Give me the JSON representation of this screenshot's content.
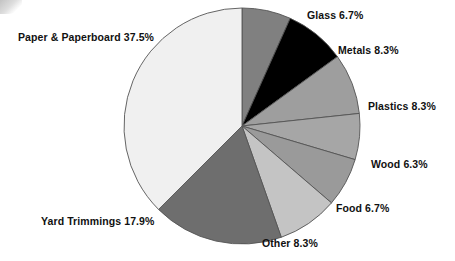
{
  "chart_data": {
    "type": "pie",
    "title": "",
    "subtitle": "",
    "xlabel": "",
    "ylabel": "",
    "legend_position": "none",
    "grid": false,
    "units": "percent",
    "start_angle_deg": 0,
    "direction": "clockwise",
    "center": {
      "x": 242,
      "y": 126
    },
    "radius": 118,
    "categories": [
      "Glass",
      "Metals",
      "Plastics",
      "Wood",
      "Food",
      "Other",
      "Yard Trimmings",
      "Paper & Paperboard"
    ],
    "values": [
      6.7,
      8.3,
      8.3,
      6.3,
      6.7,
      8.3,
      17.9,
      37.5
    ],
    "colors": [
      "#808080",
      "#000000",
      "#9e9e9e",
      "#a6a6a6",
      "#9a9a9a",
      "#c4c4c4",
      "#6e6e6e",
      "#f0f0f0"
    ],
    "slices": [
      {
        "label": "Glass",
        "value": 6.7,
        "value_text": "6.7%",
        "label_text": "Glass 6.7%",
        "color": "#808080"
      },
      {
        "label": "Metals",
        "value": 8.3,
        "value_text": "8.3%",
        "label_text": "Metals 8.3%",
        "color": "#000000"
      },
      {
        "label": "Plastics",
        "value": 8.3,
        "value_text": "8.3%",
        "label_text": "Plastics 8.3%",
        "color": "#9e9e9e"
      },
      {
        "label": "Wood",
        "value": 6.3,
        "value_text": "6.3%",
        "label_text": "Wood 6.3%",
        "color": "#a6a6a6"
      },
      {
        "label": "Food",
        "value": 6.7,
        "value_text": "6.7%",
        "label_text": "Food 6.7%",
        "color": "#9a9a9a"
      },
      {
        "label": "Other",
        "value": 8.3,
        "value_text": "8.3%",
        "label_text": "Other 8.3%",
        "color": "#c4c4c4"
      },
      {
        "label": "Yard Trimmings",
        "value": 17.9,
        "value_text": "17.9%",
        "label_text": "Yard Trimmings 17.9%",
        "color": "#6e6e6e"
      },
      {
        "label": "Paper & Paperboard",
        "value": 37.5,
        "value_text": "37.5%",
        "label_text": "Paper & Paperboard 37.5%",
        "color": "#f0f0f0"
      }
    ]
  },
  "labels": {
    "paper": "Paper & Paperboard 37.5%",
    "glass": "Glass 6.7%",
    "metals": "Metals 8.3%",
    "plastics": "Plastics 8.3%",
    "wood": "Wood 6.3%",
    "food": "Food 6.7%",
    "other": "Other 8.3%",
    "yard_trimmings": "Yard Trimmings 17.9%"
  },
  "style": {
    "background": "#ffffff",
    "outline": "#555555",
    "text": "#111111"
  }
}
